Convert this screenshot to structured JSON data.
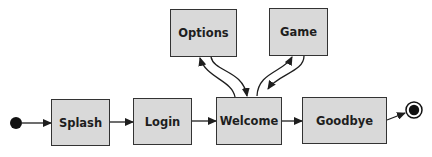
{
  "diagram": {
    "type": "state-diagram",
    "colors": {
      "state_fill": "#d9d9d9",
      "state_border": "#333333",
      "line": "#1e1e1e"
    },
    "initial_state": {
      "x": 16,
      "y": 123,
      "r": 6
    },
    "final_state": {
      "x": 414,
      "y": 110,
      "r_outer": 8,
      "r_inner": 5
    },
    "states": [
      {
        "id": "splash",
        "label": "Splash",
        "x": 51,
        "y": 99,
        "w": 59,
        "h": 47
      },
      {
        "id": "login",
        "label": "Login",
        "x": 133,
        "y": 98,
        "w": 59,
        "h": 47
      },
      {
        "id": "welcome",
        "label": "Welcome",
        "x": 216,
        "y": 97,
        "w": 66,
        "h": 48
      },
      {
        "id": "goodbye",
        "label": "Goodbye",
        "x": 302,
        "y": 97,
        "w": 85,
        "h": 47
      },
      {
        "id": "options",
        "label": "Options",
        "x": 170,
        "y": 9,
        "w": 67,
        "h": 48
      },
      {
        "id": "game",
        "label": "Game",
        "x": 269,
        "y": 8,
        "w": 59,
        "h": 48
      }
    ],
    "transitions": [
      {
        "from": "initial",
        "to": "splash"
      },
      {
        "from": "splash",
        "to": "login"
      },
      {
        "from": "login",
        "to": "welcome"
      },
      {
        "from": "welcome",
        "to": "goodbye"
      },
      {
        "from": "goodbye",
        "to": "final"
      },
      {
        "from": "welcome",
        "to": "options"
      },
      {
        "from": "options",
        "to": "welcome"
      },
      {
        "from": "welcome",
        "to": "game"
      },
      {
        "from": "game",
        "to": "welcome"
      }
    ]
  }
}
